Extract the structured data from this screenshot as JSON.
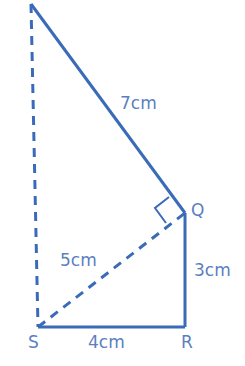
{
  "diagram": {
    "colors": {
      "line": "#3a6bb8",
      "label": "#5b7fbf"
    },
    "vertices": {
      "top": "",
      "Q": "Q",
      "R": "R",
      "S": "S"
    },
    "edges": {
      "top_Q": {
        "length": "7cm",
        "style": "solid"
      },
      "Q_R": {
        "length": "3cm",
        "style": "solid"
      },
      "S_R": {
        "length": "4cm",
        "style": "solid"
      },
      "S_Q": {
        "length": "5cm",
        "style": "dashed"
      },
      "S_top": {
        "length": "",
        "style": "dashed"
      }
    },
    "right_angle_at": "Q"
  }
}
